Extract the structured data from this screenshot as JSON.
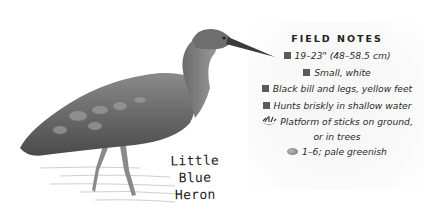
{
  "illustration": {
    "subject": "heron-illustration",
    "caption_line1": "Little Blue",
    "caption_line2": "Heron"
  },
  "field_notes": {
    "title": "FIELD NOTES",
    "items": [
      {
        "icon": "square-bullet-icon",
        "text": "19–23\" (48–58.5 cm)"
      },
      {
        "icon": "square-bullet-icon",
        "text": "Small, white"
      },
      {
        "icon": "square-bullet-icon",
        "text": "Black bill and legs, yellow feet"
      },
      {
        "icon": "square-bullet-icon",
        "text": "Hunts briskly in shallow water"
      },
      {
        "icon": "nest-icon",
        "text": "Platform of sticks on ground, or in trees"
      },
      {
        "icon": "egg-icon",
        "text": "1–6; pale greenish"
      }
    ]
  },
  "colors": {
    "background": "#ffffff",
    "bullet": "#5a5a5a",
    "text": "#2a2a2a"
  }
}
